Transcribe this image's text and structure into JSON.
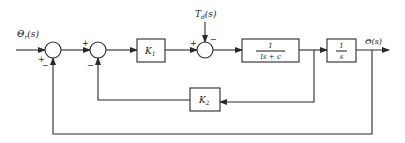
{
  "diagram": {
    "type": "block-diagram",
    "input_label": "Θr(s)",
    "input_symbol": "Θ",
    "input_subscript": "r",
    "input_arg": "(s)",
    "output_label": "Θ(s)",
    "disturbance_symbol": "T",
    "disturbance_subscript": "d",
    "disturbance_arg": "(s)",
    "blocks": {
      "k1": {
        "symbol": "K",
        "subscript": "1"
      },
      "plant": {
        "numerator": "1",
        "denominator": "Is + c"
      },
      "integrator": {
        "numerator": "1",
        "denominator": "s"
      },
      "k2": {
        "symbol": "K",
        "subscript": "2"
      }
    },
    "summers": {
      "s1": {
        "top_left_sign": "+",
        "bottom_sign": "−"
      },
      "s2": {
        "top_left_sign": "+",
        "bottom_sign": "−"
      },
      "s3": {
        "left_sign": "+",
        "top_sign": "−"
      }
    }
  }
}
